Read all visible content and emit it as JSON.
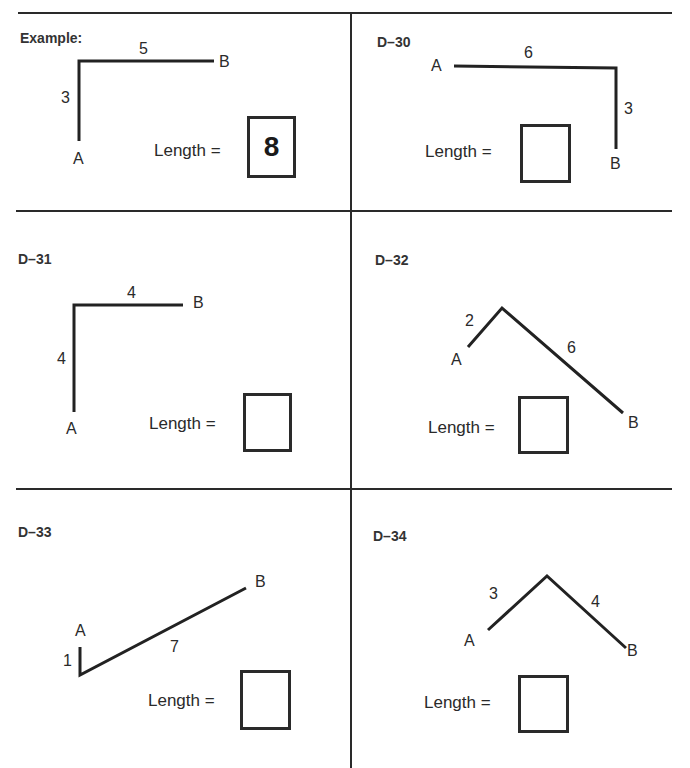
{
  "panels": [
    {
      "id": "example",
      "title": "Example:",
      "segments": [
        {
          "label": "3"
        },
        {
          "label": "5"
        }
      ],
      "point_a": "A",
      "point_b": "B",
      "length_label": "Length =",
      "answer": "8"
    },
    {
      "id": "D-30",
      "title": "D–30",
      "segments": [
        {
          "label": "6"
        },
        {
          "label": "3"
        }
      ],
      "point_a": "A",
      "point_b": "B",
      "length_label": "Length =",
      "answer": ""
    },
    {
      "id": "D-31",
      "title": "D–31",
      "segments": [
        {
          "label": "4"
        },
        {
          "label": "4"
        }
      ],
      "point_a": "A",
      "point_b": "B",
      "length_label": "Length =",
      "answer": ""
    },
    {
      "id": "D-32",
      "title": "D–32",
      "segments": [
        {
          "label": "2"
        },
        {
          "label": "6"
        }
      ],
      "point_a": "A",
      "point_b": "B",
      "length_label": "Length =",
      "answer": ""
    },
    {
      "id": "D-33",
      "title": "D–33",
      "segments": [
        {
          "label": "1"
        },
        {
          "label": "7"
        }
      ],
      "point_a": "A",
      "point_b": "B",
      "length_label": "Length =",
      "answer": ""
    },
    {
      "id": "D-34",
      "title": "D–34",
      "segments": [
        {
          "label": "3"
        },
        {
          "label": "4"
        }
      ],
      "point_a": "A",
      "point_b": "B",
      "length_label": "Length =",
      "answer": ""
    }
  ]
}
